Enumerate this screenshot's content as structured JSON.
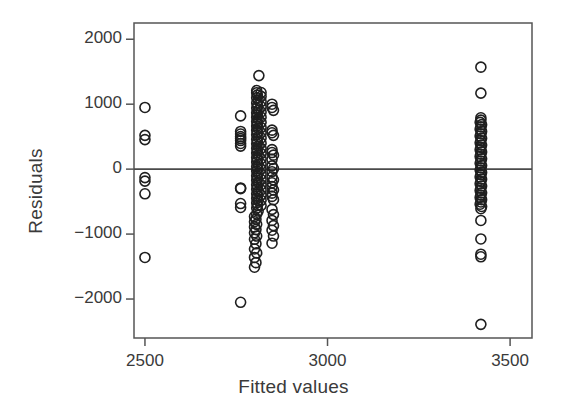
{
  "figure": {
    "type": "residual-plot",
    "background": "#ffffff",
    "ink": "#2b2b2b"
  },
  "chart_data": {
    "type": "scatter",
    "title": "",
    "xlabel": "Fitted values",
    "ylabel": "Residuals",
    "xlim": [
      2470,
      3560
    ],
    "ylim": [
      -2600,
      2250
    ],
    "xticks": [
      2500,
      3000,
      3500
    ],
    "xticklabels": [
      "2500",
      "3000",
      "3500"
    ],
    "yticks": [
      2000,
      1000,
      0,
      -1000,
      -2000
    ],
    "yticklabels": [
      "2000",
      "1000",
      "0",
      "-1000",
      "-2000"
    ],
    "grid": false,
    "legend": null,
    "marker": {
      "shape": "circle-open",
      "fill": "none",
      "stroke": "#1f1f1f",
      "radius_px": 5,
      "stroke_width": 1.6
    },
    "reference_lines": [
      {
        "orientation": "horizontal",
        "y": 0,
        "color": "#4a4a4a",
        "width": 1.6
      }
    ],
    "points": [
      [
        2500,
        950
      ],
      [
        2500,
        520
      ],
      [
        2500,
        455
      ],
      [
        2500,
        -130
      ],
      [
        2500,
        -185
      ],
      [
        2500,
        -380
      ],
      [
        2500,
        -1360
      ],
      [
        2762,
        820
      ],
      [
        2762,
        580
      ],
      [
        2762,
        540
      ],
      [
        2762,
        500
      ],
      [
        2762,
        470
      ],
      [
        2762,
        440
      ],
      [
        2762,
        395
      ],
      [
        2762,
        355
      ],
      [
        2762,
        -290
      ],
      [
        2762,
        -300
      ],
      [
        2762,
        -530
      ],
      [
        2762,
        -590
      ],
      [
        2762,
        -2050
      ],
      [
        2812,
        1440
      ],
      [
        2806,
        1210
      ],
      [
        2806,
        1175
      ],
      [
        2808,
        1140
      ],
      [
        2806,
        1100
      ],
      [
        2810,
        1060
      ],
      [
        2806,
        1020
      ],
      [
        2808,
        980
      ],
      [
        2806,
        940
      ],
      [
        2810,
        905
      ],
      [
        2806,
        870
      ],
      [
        2808,
        835
      ],
      [
        2806,
        800
      ],
      [
        2810,
        770
      ],
      [
        2806,
        735
      ],
      [
        2808,
        700
      ],
      [
        2806,
        665
      ],
      [
        2810,
        630
      ],
      [
        2806,
        600
      ],
      [
        2808,
        565
      ],
      [
        2806,
        530
      ],
      [
        2810,
        495
      ],
      [
        2806,
        460
      ],
      [
        2808,
        425
      ],
      [
        2806,
        390
      ],
      [
        2810,
        355
      ],
      [
        2806,
        320
      ],
      [
        2808,
        285
      ],
      [
        2806,
        250
      ],
      [
        2810,
        215
      ],
      [
        2806,
        180
      ],
      [
        2808,
        145
      ],
      [
        2806,
        110
      ],
      [
        2810,
        75
      ],
      [
        2806,
        40
      ],
      [
        2808,
        5
      ],
      [
        2806,
        -30
      ],
      [
        2810,
        -65
      ],
      [
        2806,
        -100
      ],
      [
        2808,
        -135
      ],
      [
        2806,
        -170
      ],
      [
        2810,
        -205
      ],
      [
        2806,
        -240
      ],
      [
        2808,
        -275
      ],
      [
        2806,
        -310
      ],
      [
        2810,
        -345
      ],
      [
        2806,
        -380
      ],
      [
        2808,
        -415
      ],
      [
        2806,
        -450
      ],
      [
        2810,
        -485
      ],
      [
        2806,
        -520
      ],
      [
        2808,
        -560
      ],
      [
        2806,
        -600
      ],
      [
        2810,
        -645
      ],
      [
        2806,
        -690
      ],
      [
        2818,
        1180
      ],
      [
        2818,
        1120
      ],
      [
        2818,
        1040
      ],
      [
        2818,
        960
      ],
      [
        2818,
        880
      ],
      [
        2818,
        800
      ],
      [
        2818,
        720
      ],
      [
        2818,
        640
      ],
      [
        2818,
        560
      ],
      [
        2818,
        480
      ],
      [
        2818,
        400
      ],
      [
        2818,
        320
      ],
      [
        2818,
        240
      ],
      [
        2818,
        160
      ],
      [
        2818,
        80
      ],
      [
        2818,
        0
      ],
      [
        2818,
        -80
      ],
      [
        2818,
        -160
      ],
      [
        2818,
        -240
      ],
      [
        2818,
        -320
      ],
      [
        2818,
        -400
      ],
      [
        2818,
        -480
      ],
      [
        2818,
        -560
      ],
      [
        2800,
        -730
      ],
      [
        2804,
        -770
      ],
      [
        2800,
        -810
      ],
      [
        2806,
        -850
      ],
      [
        2800,
        -890
      ],
      [
        2804,
        -930
      ],
      [
        2800,
        -980
      ],
      [
        2806,
        -1030
      ],
      [
        2800,
        -1080
      ],
      [
        2804,
        -1150
      ],
      [
        2800,
        -1230
      ],
      [
        2806,
        -1290
      ],
      [
        2800,
        -1360
      ],
      [
        2804,
        -1440
      ],
      [
        2800,
        -1510
      ],
      [
        2848,
        1000
      ],
      [
        2848,
        950
      ],
      [
        2852,
        905
      ],
      [
        2848,
        600
      ],
      [
        2848,
        560
      ],
      [
        2852,
        520
      ],
      [
        2848,
        300
      ],
      [
        2848,
        255
      ],
      [
        2852,
        215
      ],
      [
        2848,
        150
      ],
      [
        2848,
        50
      ],
      [
        2852,
        10
      ],
      [
        2848,
        -40
      ],
      [
        2848,
        -120
      ],
      [
        2852,
        -165
      ],
      [
        2848,
        -210
      ],
      [
        2848,
        -270
      ],
      [
        2852,
        -320
      ],
      [
        2848,
        -370
      ],
      [
        2848,
        -420
      ],
      [
        2852,
        -470
      ],
      [
        2848,
        -620
      ],
      [
        2852,
        -700
      ],
      [
        2848,
        -790
      ],
      [
        2852,
        -870
      ],
      [
        2848,
        -940
      ],
      [
        2852,
        -1030
      ],
      [
        2848,
        -1140
      ],
      [
        3420,
        1570
      ],
      [
        3420,
        1170
      ],
      [
        3420,
        790
      ],
      [
        3420,
        755
      ],
      [
        3418,
        720
      ],
      [
        3422,
        685
      ],
      [
        3420,
        650
      ],
      [
        3418,
        615
      ],
      [
        3422,
        580
      ],
      [
        3420,
        545
      ],
      [
        3418,
        510
      ],
      [
        3422,
        475
      ],
      [
        3420,
        440
      ],
      [
        3418,
        405
      ],
      [
        3422,
        370
      ],
      [
        3420,
        335
      ],
      [
        3418,
        300
      ],
      [
        3422,
        265
      ],
      [
        3420,
        230
      ],
      [
        3418,
        195
      ],
      [
        3422,
        160
      ],
      [
        3420,
        125
      ],
      [
        3418,
        90
      ],
      [
        3422,
        55
      ],
      [
        3420,
        20
      ],
      [
        3418,
        -15
      ],
      [
        3422,
        -50
      ],
      [
        3420,
        -85
      ],
      [
        3418,
        -120
      ],
      [
        3422,
        -155
      ],
      [
        3420,
        -190
      ],
      [
        3418,
        -225
      ],
      [
        3422,
        -260
      ],
      [
        3420,
        -295
      ],
      [
        3418,
        -330
      ],
      [
        3422,
        -365
      ],
      [
        3420,
        -400
      ],
      [
        3418,
        -435
      ],
      [
        3422,
        -470
      ],
      [
        3420,
        -505
      ],
      [
        3418,
        -540
      ],
      [
        3422,
        -575
      ],
      [
        3420,
        -610
      ],
      [
        3420,
        -790
      ],
      [
        3420,
        -1075
      ],
      [
        3420,
        -1310
      ],
      [
        3420,
        -1350
      ],
      [
        3420,
        -2390
      ]
    ]
  }
}
